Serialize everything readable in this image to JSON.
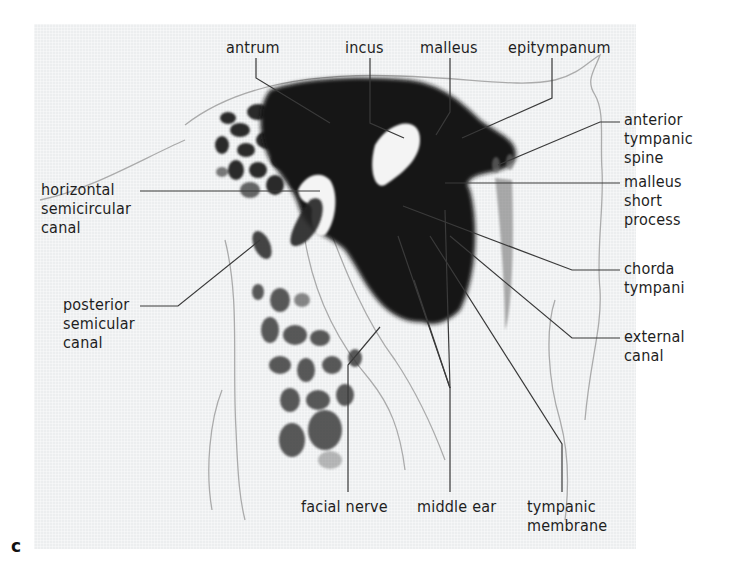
{
  "figure": {
    "panel_letter": "c",
    "colors": {
      "background": "#eceeef",
      "ink": "#1e1e1e",
      "leader": "#3a3a3a",
      "tissue_dark": "#141414"
    }
  },
  "labels": {
    "top": [
      {
        "id": "antrum",
        "text": "antrum"
      },
      {
        "id": "incus",
        "text": "incus"
      },
      {
        "id": "malleus",
        "text": "malleus"
      },
      {
        "id": "epitympanum",
        "text": "epitympanum"
      }
    ],
    "right": [
      {
        "id": "anterior-tympanic-spine",
        "lines": [
          "anterior",
          "tympanic",
          "spine"
        ]
      },
      {
        "id": "malleus-short-process",
        "lines": [
          "malleus",
          "short",
          "process"
        ]
      },
      {
        "id": "chorda-tympani",
        "lines": [
          "chorda",
          "tympani"
        ]
      },
      {
        "id": "external-canal",
        "lines": [
          "external",
          "canal"
        ]
      }
    ],
    "left": [
      {
        "id": "horizontal-semicircular-canal",
        "lines": [
          "horizontal",
          "semicircular",
          "canal"
        ]
      },
      {
        "id": "posterior-semicular-canal",
        "lines": [
          "posterior",
          "semicular",
          "canal"
        ]
      }
    ],
    "bottom": [
      {
        "id": "facial-nerve",
        "text": "facial nerve"
      },
      {
        "id": "middle-ear",
        "text": "middle ear"
      },
      {
        "id": "tympanic-membrane",
        "lines": [
          "tympanic",
          "membrane"
        ]
      }
    ]
  }
}
